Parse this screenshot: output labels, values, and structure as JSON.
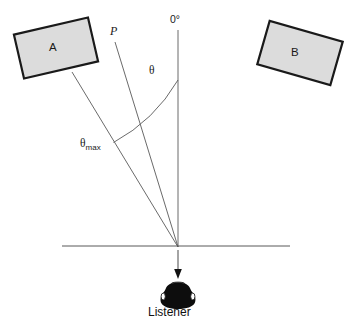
{
  "diagram": {
    "labels": {
      "zero_degrees": "0°",
      "phantom_source": "P",
      "theta": "θ",
      "theta_max_base": "θ",
      "theta_max_sub": "max",
      "speaker_a": "A",
      "speaker_b": "B",
      "listener": "Listener"
    },
    "colors": {
      "line": "#595959",
      "outline": "#1a1a1a",
      "speaker_fill": "#d9d9d9",
      "listener_fill": "#0d0d0d",
      "background": "#ffffff"
    },
    "geometry": {
      "vertex": {
        "x": 178,
        "y": 247
      },
      "reference_axis": {
        "x": 178,
        "y_top": 30,
        "y_bottom": 247
      },
      "phantom_ray": {
        "x1": 115,
        "y1": 42,
        "x2": 178,
        "y2": 247
      },
      "speaker_a_ray": {
        "x1": 72,
        "y1": 72,
        "x2": 178,
        "y2": 247
      },
      "baseline": {
        "x1": 62,
        "x2": 290,
        "y": 246
      },
      "listener_arrow": {
        "x": 178,
        "y_top": 250,
        "y_bottom": 277
      },
      "theta_arc": {
        "start_x": 178,
        "start_y": 80,
        "end_x": 113,
        "end_y": 142
      },
      "speaker_a_box": {
        "cx": 56,
        "cy": 48,
        "w": 76,
        "h": 45,
        "rotation_deg": -13
      },
      "speaker_b_box": {
        "cx": 300,
        "cy": 53,
        "w": 76,
        "h": 45,
        "rotation_deg": 16
      }
    }
  }
}
